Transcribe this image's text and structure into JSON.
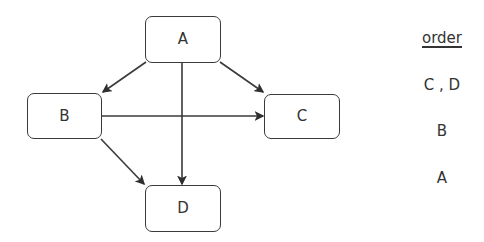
{
  "diagram": {
    "type": "directed-graph",
    "nodes": [
      {
        "id": "A",
        "label": "A"
      },
      {
        "id": "B",
        "label": "B"
      },
      {
        "id": "C",
        "label": "C"
      },
      {
        "id": "D",
        "label": "D"
      }
    ],
    "edges": [
      {
        "from": "A",
        "to": "B"
      },
      {
        "from": "A",
        "to": "C"
      },
      {
        "from": "A",
        "to": "D"
      },
      {
        "from": "B",
        "to": "C"
      },
      {
        "from": "B",
        "to": "D"
      }
    ],
    "colors": {
      "stroke": "#3a3a3a",
      "text": "#333333",
      "background": "#ffffff"
    }
  },
  "order_panel": {
    "title": "order",
    "items": [
      "C , D",
      "B",
      "A"
    ]
  }
}
